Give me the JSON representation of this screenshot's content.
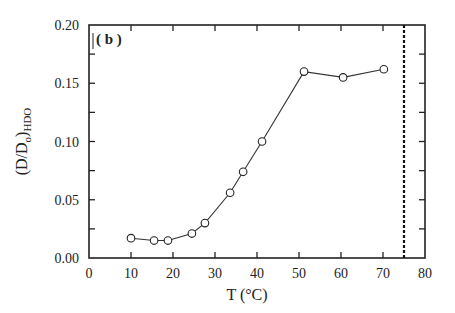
{
  "chart_data": {
    "type": "line",
    "title": "",
    "panel_label": "( b )",
    "xlabel": "T (°C)",
    "ylabel_main": "(D/D",
    "ylabel_sub_o": "o",
    "ylabel_close": ")",
    "ylabel_sub": "HDO",
    "xlim": [
      0,
      80
    ],
    "ylim": [
      0,
      0.2
    ],
    "x_ticks": [
      0,
      10,
      20,
      30,
      40,
      50,
      60,
      70,
      80
    ],
    "x_tick_labels": [
      "0",
      "10",
      "20",
      "30",
      "40",
      "50",
      "60",
      "70",
      "80"
    ],
    "y_ticks": [
      0,
      0.05,
      0.1,
      0.15,
      0.2
    ],
    "y_tick_labels": [
      "0.00",
      "0.05",
      "0.10",
      "0.15",
      "0.20"
    ],
    "y_minor_step": 0.025,
    "grid": false,
    "marker": "open-circle",
    "series": [
      {
        "name": "D/Do HDO",
        "x": [
          10.0,
          15.5,
          18.8,
          24.5,
          27.6,
          33.6,
          36.7,
          41.2,
          51.2,
          60.5,
          70.2
        ],
        "y": [
          0.017,
          0.015,
          0.015,
          0.021,
          0.03,
          0.056,
          0.074,
          0.1,
          0.16,
          0.155,
          0.162
        ]
      }
    ],
    "reference_lines": [
      {
        "orientation": "vertical",
        "x": 75,
        "style": "dashed"
      }
    ]
  }
}
